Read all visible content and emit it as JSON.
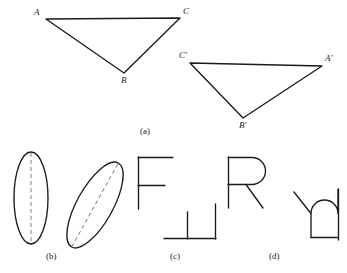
{
  "figure": {
    "ink_color": "#1b1b1b",
    "dash_color": "#6e6e6e",
    "background_color": "#ffffff"
  },
  "captions": [
    {
      "key": "a",
      "label": "(a)"
    },
    {
      "key": "b",
      "label": "(b)"
    },
    {
      "key": "c",
      "label": "(c)"
    },
    {
      "key": "d",
      "label": "(d)"
    }
  ],
  "part_a": {
    "caption": "(a)",
    "triangle_left": {
      "name": "triangle-abc",
      "vertices": [
        {
          "label": "A",
          "x": 46,
          "y": 19
        },
        {
          "label": "C",
          "x": 180,
          "y": 18
        },
        {
          "label": "B",
          "x": 124,
          "y": 73
        }
      ]
    },
    "triangle_right": {
      "name": "triangle-a-prime-b-prime-c-prime",
      "vertices": [
        {
          "label": "C'",
          "x": 190,
          "y": 63
        },
        {
          "label": "A'",
          "x": 322,
          "y": 66
        },
        {
          "label": "B'",
          "x": 243,
          "y": 118
        }
      ]
    }
  },
  "part_b": {
    "caption": "(b)",
    "shapes": [
      {
        "name": "ellipse-upright",
        "rotation_deg": 0,
        "center_x": 31,
        "center_y": 198,
        "radius_x": 17,
        "radius_y": 46,
        "axis": "dashed-vertical"
      },
      {
        "name": "ellipse-tilted",
        "rotation_deg": 29,
        "center_x": 95,
        "center_y": 205,
        "radius_x": 18,
        "radius_y": 48,
        "axis": "dashed-major"
      }
    ]
  },
  "part_c": {
    "caption": "(c)",
    "shapes": [
      {
        "name": "letter-f-upright",
        "glyph": "F",
        "rotation_deg": 0
      },
      {
        "name": "letter-f-rotated",
        "glyph": "F",
        "rotation_deg": 90
      }
    ]
  },
  "part_d": {
    "caption": "(d)",
    "shapes": [
      {
        "name": "letter-r-upright",
        "glyph": "R",
        "rotation_deg": 0
      },
      {
        "name": "letter-r-rotated",
        "glyph": "R",
        "rotation_deg": 90
      }
    ]
  }
}
